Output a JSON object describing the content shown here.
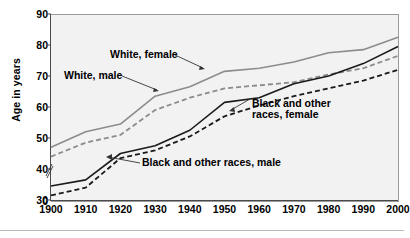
{
  "chart_data": {
    "type": "line",
    "title": "",
    "xlabel": "",
    "ylabel": "Age in years",
    "x": [
      1900,
      1910,
      1920,
      1930,
      1940,
      1950,
      1960,
      1970,
      1980,
      1990,
      2000
    ],
    "xlim": [
      1900,
      2000
    ],
    "ylim": [
      30,
      90
    ],
    "y_axis_break": true,
    "y_zero_label": "0",
    "yticks": [
      30,
      40,
      50,
      60,
      70,
      80,
      90
    ],
    "xticks": [
      "1900",
      "1910",
      "1920",
      "1930",
      "1940",
      "1950",
      "1960",
      "1970",
      "1980",
      "1990",
      "2000"
    ],
    "grid": false,
    "legend": "inline-annotations",
    "series": [
      {
        "name": "White, female",
        "style": "solid",
        "color": "#8c8c8c",
        "values": [
          47,
          52,
          54.5,
          63.5,
          66.5,
          71.5,
          72.5,
          74.5,
          77.5,
          78.5,
          82.5
        ]
      },
      {
        "name": "White, male",
        "style": "dashed",
        "color": "#8c8c8c",
        "values": [
          44,
          48.5,
          51,
          59,
          63,
          66,
          67,
          68,
          70.5,
          72.5,
          76.5
        ]
      },
      {
        "name": "Black and other races, male",
        "style": "solid",
        "color": "#1a1a1a",
        "values": [
          34.5,
          36.5,
          45,
          47.5,
          52.5,
          61.5,
          63,
          67.5,
          70,
          74,
          79.5
        ]
      },
      {
        "name": "Black and other races, female",
        "style": "dashed",
        "color": "#1a1a1a",
        "values": [
          31.5,
          34,
          43.5,
          46,
          50.5,
          57,
          60.5,
          63.5,
          66,
          68.5,
          72
        ]
      }
    ],
    "annotations": [
      {
        "id": "white-female",
        "text": "White, female"
      },
      {
        "id": "white-male",
        "text": "White, male"
      },
      {
        "id": "black-female",
        "text_line1": "Black and other",
        "text_line2": "races, female"
      },
      {
        "id": "black-male",
        "text": "Black and other races, male"
      }
    ]
  }
}
